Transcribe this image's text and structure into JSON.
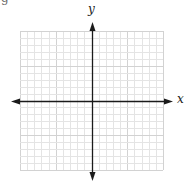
{
  "diagram": {
    "type": "coordinate-plane",
    "corner_glyph": "g",
    "x_axis_label": "x",
    "y_axis_label": "y",
    "grid": {
      "left": 20,
      "top": 31,
      "right": 163,
      "bottom": 170,
      "cols": 20,
      "rows": 20,
      "minor_color": "#e4e4e4",
      "major_color": "#d2d2d2"
    },
    "axes": {
      "origin_x": 92,
      "origin_y": 101,
      "x_arrow_left": 11,
      "x_arrow_right": 173,
      "y_arrow_top": 22,
      "y_arrow_bottom": 181,
      "color": "#1a1a1a"
    }
  }
}
